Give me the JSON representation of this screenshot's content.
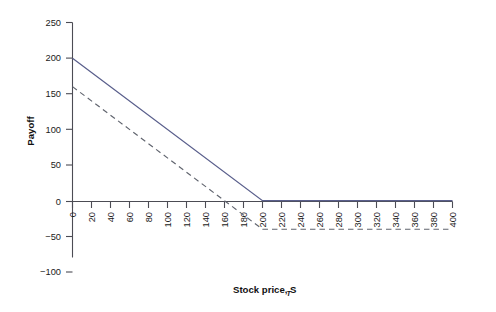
{
  "chart_data": {
    "type": "line",
    "title": "",
    "xlabel": "Stock price, S",
    "xlabel_subscript": "T",
    "ylabel": "Payoff",
    "xlim": [
      0,
      400
    ],
    "ylim": [
      -100,
      250
    ],
    "grid": false,
    "legend": "none",
    "x_ticks": [
      0,
      20,
      40,
      60,
      80,
      100,
      120,
      140,
      160,
      180,
      200,
      220,
      240,
      260,
      280,
      300,
      320,
      340,
      360,
      380,
      400
    ],
    "x_tick_labels": [
      "0",
      "20",
      "40",
      "60",
      "80",
      "100",
      "120",
      "140",
      "160",
      "180",
      "200",
      "220",
      "240",
      "260",
      "280",
      "300",
      "320",
      "340",
      "360",
      "380",
      "400"
    ],
    "x_tick_label_rotation": -90,
    "y_ticks": [
      -100,
      -50,
      0,
      50,
      100,
      150,
      200,
      250
    ],
    "y_tick_labels": [
      "−100",
      "−50",
      "0",
      "50",
      "100",
      "150",
      "200",
      "250"
    ],
    "series": [
      {
        "name": "short-call-payoff",
        "style": "solid",
        "color": "#5a5f8c",
        "points": [
          [
            0,
            200
          ],
          [
            200,
            0
          ],
          [
            400,
            0
          ]
        ]
      },
      {
        "name": "short-call-profit",
        "style": "dashed",
        "color": "#60646e",
        "points": [
          [
            0,
            160
          ],
          [
            200,
            -40
          ],
          [
            400,
            -40
          ]
        ]
      }
    ]
  },
  "colors": {
    "background": "#ffffff",
    "axis": "#4c4c54",
    "solid_series": "#5a5f8c",
    "dashed_series": "#60646e",
    "text": "#1a1a1a"
  }
}
